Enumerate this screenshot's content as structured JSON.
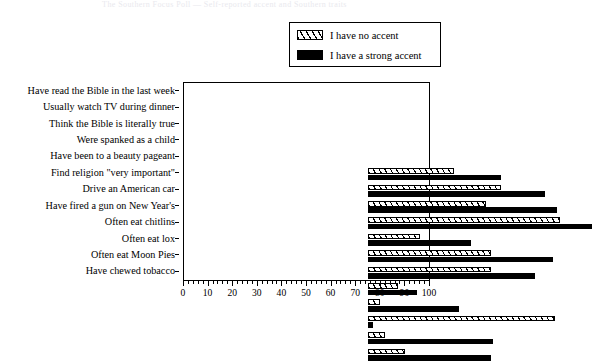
{
  "title_strip": "The Southern Focus Poll — Self-reported accent and Southern traits",
  "legend": {
    "position": "top-right",
    "items": [
      {
        "label": "I have no accent",
        "swatch": "hatch-swatch",
        "color": "#000000"
      },
      {
        "label": "I have a strong accent",
        "swatch": "solid-swatch",
        "color": "#000000"
      }
    ]
  },
  "chart_data": {
    "type": "bar",
    "orientation": "horizontal",
    "title": "",
    "xlabel": "",
    "ylabel": "",
    "xlim": [
      0,
      100
    ],
    "xticks": [
      0,
      10,
      20,
      30,
      40,
      50,
      60,
      70,
      80,
      90,
      100
    ],
    "xtick_labels": [
      "0",
      "10",
      "20",
      "30",
      "40",
      "50",
      "60",
      "70",
      "80",
      "90",
      "100"
    ],
    "minor_tick_step": 2,
    "grid": false,
    "legend_position": "upper right",
    "categories": [
      "Have read the Bible in the last week",
      "Usually watch TV during dinner",
      "Think the Bible is literally true",
      "Were spanked as a child",
      "Have been to a beauty pageant",
      "Find religion \"very important\"",
      "Drive an American car",
      "Have fired a gun on New Year's",
      "Often eat chitlins",
      "Often eat lox",
      "Often eat Moon Pies",
      "Have chewed tobacco"
    ],
    "series": [
      {
        "name": "I have no accent",
        "style": "hatched",
        "values": [
          35,
          54,
          48,
          78,
          21,
          50,
          50,
          12,
          5,
          76,
          7,
          15
        ]
      },
      {
        "name": "I have a strong accent",
        "style": "solid",
        "values": [
          54,
          72,
          77,
          91,
          42,
          75,
          68,
          20,
          37,
          2,
          51,
          50
        ]
      }
    ]
  }
}
